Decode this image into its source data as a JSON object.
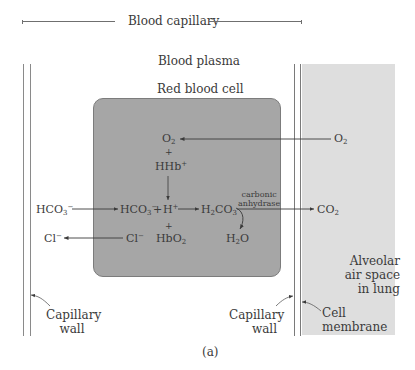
{
  "header": {
    "title": "Blood capillary"
  },
  "regions": {
    "plasma": "Blood plasma",
    "rbc": "Red blood cell",
    "alveolar_line1": "Alveolar",
    "alveolar_line2": "air space",
    "alveolar_line3": "in lung"
  },
  "species": {
    "o2_cell": {
      "base": "O",
      "sub": "2"
    },
    "plus1": "+",
    "hhb": {
      "base": "HHb",
      "sup": "+"
    },
    "o2_lung": {
      "base": "O",
      "sub": "2"
    },
    "hco3_plasma": {
      "base": "HCO",
      "sub": "3",
      "sup": "−"
    },
    "hco3_cell": {
      "base": "HCO",
      "sub": "3",
      "sup": "−"
    },
    "plus2": "+",
    "h_ion": {
      "base": "H",
      "sup": "+"
    },
    "h2co3": {
      "pre": "H",
      "sub1": "2",
      "mid": "CO",
      "sub2": "3"
    },
    "co2_lung": {
      "base": "CO",
      "sub": "2"
    },
    "plus3": "+",
    "cl_plasma": {
      "base": "Cl",
      "sup": "−"
    },
    "cl_cell": {
      "base": "Cl",
      "sup": "−"
    },
    "hbo2": {
      "base": "HbO",
      "sub": "2"
    },
    "h2o": {
      "pre": "H",
      "sub": "2",
      "post": "O"
    }
  },
  "enzyme": {
    "line1": "carbonic",
    "line2": "anhydrase"
  },
  "annotations": {
    "left_wall_1": "Capillary",
    "left_wall_2": "wall",
    "right_wall_1": "Capillary",
    "right_wall_2": "wall",
    "membrane_1": "Cell",
    "membrane_2": "membrane"
  },
  "caption": "(a)",
  "colors": {
    "rbc_fill": "#a6a6a6",
    "alveolar_fill": "#dedede",
    "line": "#6f6f6f",
    "text": "#3a3a3a"
  }
}
